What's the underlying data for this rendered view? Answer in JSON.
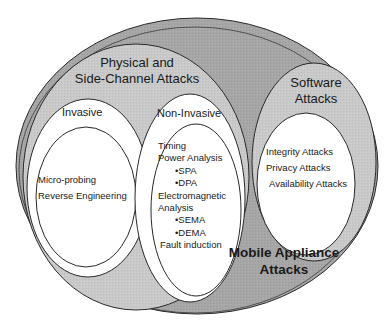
{
  "diagram": {
    "type": "nested-ellipse (Venn/taxonomy)",
    "colors": {
      "outer_fill": "#a9a9a9",
      "mid_fill": "#c8c8c8",
      "inner_fill": "#ffffff",
      "stroke": "#2a2a2a",
      "text": "#1a1a1a"
    },
    "outer": {
      "label_line1": "Mobile Appliance",
      "label_line2": "Attacks"
    },
    "physical": {
      "label_line1": "Physical and",
      "label_line2": "Side-Channel Attacks",
      "invasive": {
        "label": "Invasive",
        "items": [
          "Micro-probing",
          "Reverse Engineering"
        ]
      },
      "non_invasive": {
        "label": "Non-Invasive",
        "items": [
          {
            "text": "Timing",
            "indent": false
          },
          {
            "text": "Power Analysis",
            "indent": false
          },
          {
            "text": "•SPA",
            "indent": true
          },
          {
            "text": "•DPA",
            "indent": true
          },
          {
            "text": "Electromagnetic",
            "indent": false
          },
          {
            "text": "Analysis",
            "indent": false
          },
          {
            "text": "•SEMA",
            "indent": true
          },
          {
            "text": "•DEMA",
            "indent": true
          },
          {
            "text": "Fault induction",
            "indent": false
          }
        ]
      }
    },
    "software": {
      "label_line1": "Software",
      "label_line2": "Attacks",
      "items": [
        "Integrity Attacks",
        "Privacy Attacks",
        "Availability Attacks"
      ]
    }
  }
}
